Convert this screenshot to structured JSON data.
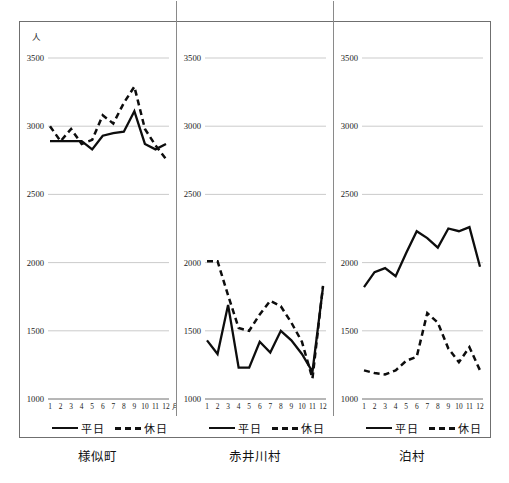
{
  "figure": {
    "unit_label": "人",
    "panel_captions": [
      "様似町",
      "赤井川村",
      "泊村"
    ],
    "legend": {
      "weekday_label": "平日",
      "holiday_label": "休日",
      "weekday_style": "solid",
      "holiday_style": "dashed"
    },
    "colors": {
      "line": "#0d0d0d",
      "grid": "#b5b5b5",
      "frame": "#6f6f6f",
      "background": "#ffffff"
    }
  },
  "chart_data": [
    {
      "type": "line",
      "title": "様似町",
      "xlabel": "月",
      "ylabel": "人",
      "categories": [
        "1",
        "2",
        "3",
        "4",
        "5",
        "6",
        "7",
        "8",
        "9",
        "10",
        "11",
        "12"
      ],
      "xtick_suffix": "月",
      "ylim": [
        1000,
        3500
      ],
      "yticks": [
        1000,
        1500,
        2000,
        2500,
        3000,
        3500
      ],
      "grid": true,
      "legend_position": "below",
      "series": [
        {
          "name": "平日",
          "style": "solid",
          "values": [
            2890,
            2890,
            2890,
            2890,
            2830,
            2930,
            2950,
            2960,
            3110,
            2870,
            2830,
            2870
          ]
        },
        {
          "name": "休日",
          "style": "dashed",
          "values": [
            3000,
            2890,
            2980,
            2870,
            2900,
            3080,
            3020,
            3170,
            3290,
            2980,
            2860,
            2760
          ]
        }
      ]
    },
    {
      "type": "line",
      "title": "赤井川村",
      "xlabel": "",
      "ylabel": "人",
      "categories": [
        "1",
        "2",
        "3",
        "4",
        "5",
        "6",
        "7",
        "8",
        "9",
        "10",
        "11",
        "12"
      ],
      "xtick_suffix": "",
      "ylim": [
        1000,
        3500
      ],
      "yticks": [
        1000,
        1500,
        2000,
        2500,
        3000,
        3500
      ],
      "grid": true,
      "legend_position": "below",
      "series": [
        {
          "name": "平日",
          "style": "solid",
          "values": [
            1430,
            1330,
            1690,
            1230,
            1230,
            1420,
            1340,
            1500,
            1430,
            1330,
            1200,
            1820
          ]
        },
        {
          "name": "休日",
          "style": "dashed",
          "values": [
            2010,
            2010,
            1760,
            1520,
            1500,
            1620,
            1720,
            1680,
            1560,
            1420,
            1150,
            1830
          ]
        }
      ]
    },
    {
      "type": "line",
      "title": "泊村",
      "xlabel": "",
      "ylabel": "人",
      "categories": [
        "1",
        "2",
        "3",
        "4",
        "5",
        "6",
        "7",
        "8",
        "9",
        "10",
        "11",
        "12"
      ],
      "xtick_suffix": "",
      "ylim": [
        1000,
        3500
      ],
      "yticks": [
        1000,
        1500,
        2000,
        2500,
        3000,
        3500
      ],
      "grid": true,
      "legend_position": "below",
      "series": [
        {
          "name": "平日",
          "style": "solid",
          "values": [
            1820,
            1930,
            1960,
            1900,
            2070,
            2230,
            2180,
            2110,
            2250,
            2230,
            2260,
            1970
          ]
        },
        {
          "name": "休日",
          "style": "dashed",
          "values": [
            1210,
            1190,
            1180,
            1210,
            1280,
            1310,
            1630,
            1560,
            1370,
            1270,
            1380,
            1210
          ]
        }
      ]
    }
  ]
}
